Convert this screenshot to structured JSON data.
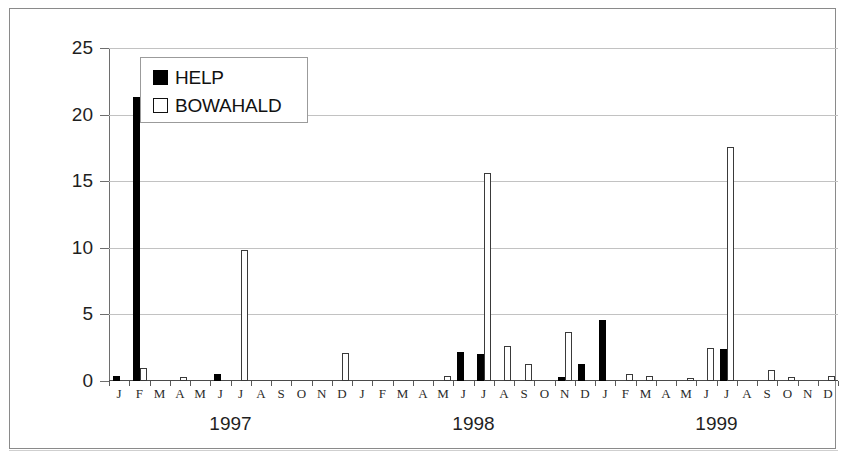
{
  "chart_data": {
    "type": "bar",
    "title": "",
    "xlabel": "",
    "ylabel": "Oberflächenabfluss [mm/mon]",
    "ylim": [
      0,
      25
    ],
    "yticks": [
      0,
      5,
      10,
      15,
      20,
      25
    ],
    "grid": true,
    "legend_position": "top-left",
    "group_labels": [
      "1997",
      "1998",
      "1999"
    ],
    "categories": [
      "J",
      "F",
      "M",
      "A",
      "M",
      "J",
      "J",
      "A",
      "S",
      "O",
      "N",
      "D",
      "J",
      "F",
      "M",
      "A",
      "M",
      "J",
      "J",
      "A",
      "S",
      "O",
      "N",
      "D",
      "J",
      "F",
      "M",
      "A",
      "M",
      "J",
      "J",
      "A",
      "S",
      "O",
      "N",
      "D"
    ],
    "series": [
      {
        "name": "HELP",
        "color": "#000000",
        "values": [
          0.4,
          21.3,
          0,
          0,
          0,
          0.5,
          0,
          0,
          0,
          0,
          0,
          0,
          0,
          0,
          0,
          0,
          0,
          2.2,
          2.0,
          0,
          0,
          0,
          0.3,
          1.3,
          4.6,
          0,
          0,
          0,
          0,
          0,
          2.4,
          0,
          0,
          0,
          0,
          0
        ]
      },
      {
        "name": "BOWAHALD",
        "color": "#ffffff",
        "values": [
          0,
          1.0,
          0,
          0.3,
          0,
          0,
          9.8,
          0,
          0,
          0,
          0,
          2.1,
          0,
          0,
          0,
          0,
          0.4,
          0,
          15.6,
          2.6,
          1.3,
          0,
          3.7,
          0,
          0,
          0.5,
          0.4,
          0,
          0.2,
          2.5,
          17.6,
          0,
          0.8,
          0.3,
          0,
          0.4
        ]
      }
    ]
  },
  "legend": {
    "items": [
      {
        "label": "HELP",
        "style": "filled"
      },
      {
        "label": "BOWAHALD",
        "style": "outline"
      }
    ]
  },
  "axis": {
    "y_title": "Oberflächenabfluss [mm/mon]",
    "y_tick_labels": [
      "25",
      "20",
      "15",
      "10",
      "5",
      "0"
    ]
  },
  "years": [
    "1997",
    "1998",
    "1999"
  ]
}
